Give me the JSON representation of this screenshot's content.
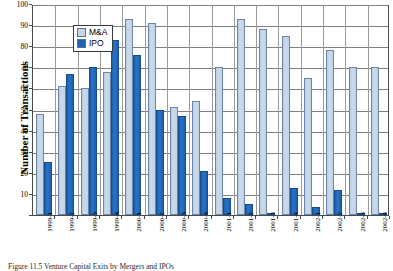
{
  "chart_data": {
    "type": "bar",
    "title": "",
    "xlabel": "",
    "ylabel": "Number of Transactions",
    "ylim": [
      0,
      100
    ],
    "yticks": [
      0,
      10,
      20,
      30,
      40,
      50,
      60,
      70,
      80,
      90,
      100
    ],
    "ytick_labels": [
      "0",
      "10",
      "20",
      "30",
      "40",
      "50",
      "60",
      "70",
      "80",
      "90",
      "100"
    ],
    "grid": true,
    "legend_position": "upper-left",
    "categories": [
      "1999-1",
      "1999-2",
      "1999-3",
      "1999-4",
      "2000-1",
      "2000-2",
      "2000-3",
      "2000-4",
      "2001-1",
      "2001-2",
      "2001-3",
      "2001-4",
      "2002-1",
      "2002-2",
      "2002-3",
      "2002-4"
    ],
    "series": [
      {
        "name": "M&A",
        "color": "#c6d6e8",
        "values": [
          48,
          61,
          60,
          68,
          93,
          91,
          51,
          54,
          70,
          93,
          88,
          85,
          65,
          78,
          70,
          70
        ]
      },
      {
        "name": "IPO",
        "color": "#1f63b2",
        "values": [
          25,
          67,
          70,
          83,
          76,
          50,
          47,
          21,
          8,
          5,
          1,
          13,
          4,
          12,
          1,
          1
        ]
      }
    ]
  },
  "legend": {
    "items": [
      {
        "label": "M&A",
        "swatch": "ma"
      },
      {
        "label": "IPO",
        "swatch": "ipo"
      }
    ]
  },
  "caption": {
    "text": "Figure 11.5   Venture Capital Exits by Mergers and IPOs"
  }
}
